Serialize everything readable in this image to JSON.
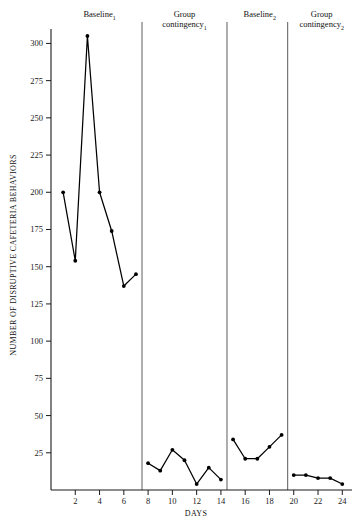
{
  "chart_data": {
    "type": "line",
    "title": "",
    "xlabel": "DAYS",
    "ylabel": "NUMBER OF DISRUPTIVE CAFETERIA BEHAVIORS",
    "xlim": [
      0,
      24.8
    ],
    "ylim": [
      0,
      307
    ],
    "grid": false,
    "legend": "none",
    "xticks": [
      2,
      4,
      6,
      8,
      10,
      12,
      14,
      16,
      18,
      20,
      22,
      24
    ],
    "xtick_labels": [
      "2",
      "4",
      "6",
      "8",
      "10",
      "12",
      "14",
      "16",
      "18",
      "20",
      "22",
      "24"
    ],
    "yticks": [
      25,
      50,
      75,
      100,
      125,
      150,
      175,
      200,
      225,
      250,
      275,
      300
    ],
    "ytick_labels": [
      "25",
      "50",
      "75",
      "100",
      "125",
      "150",
      "175",
      "200",
      "225",
      "250",
      "275",
      "300"
    ],
    "phases": [
      {
        "name": "Baseline",
        "subscript": "1",
        "label_x": 4.0,
        "start_day": 1,
        "end_day": 7
      },
      {
        "name": "Group contingency",
        "subscript": "1",
        "label_x": 11.0,
        "start_day": 8,
        "end_day": 14
      },
      {
        "name": "Baseline",
        "subscript": "2",
        "label_x": 17.2,
        "start_day": 15,
        "end_day": 19
      },
      {
        "name": "Group contingency",
        "subscript": "2",
        "label_x": 22.3,
        "start_day": 20,
        "end_day": 24
      }
    ],
    "phase_dividers": [
      7.5,
      14.5,
      19.5
    ],
    "series": [
      {
        "name": "Baseline 1",
        "x": [
          1,
          2,
          3,
          4,
          5,
          6,
          7
        ],
        "values": [
          200,
          154,
          305,
          200,
          174,
          137,
          145
        ]
      },
      {
        "name": "Group contingency 1",
        "x": [
          8,
          9,
          10,
          11,
          12,
          13,
          14
        ],
        "values": [
          18,
          13,
          27,
          20,
          4,
          15,
          7
        ]
      },
      {
        "name": "Baseline 2",
        "x": [
          15,
          16,
          17,
          18,
          19
        ],
        "values": [
          34,
          21,
          21,
          29,
          37
        ]
      },
      {
        "name": "Group contingency 2",
        "x": [
          20,
          21,
          22,
          23,
          24
        ],
        "values": [
          10,
          10,
          8,
          8,
          4
        ]
      }
    ]
  },
  "axis": {
    "y_title": "NUMBER OF DISRUPTIVE CAFETERIA BEHAVIORS",
    "x_title": "DAYS"
  }
}
